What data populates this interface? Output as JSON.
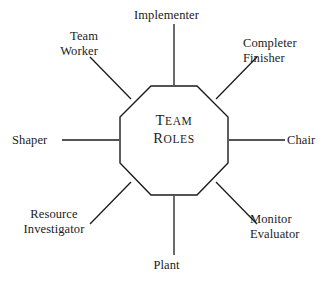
{
  "diagram": {
    "type": "radial-octagon-label-diagram",
    "title": "Team Roles",
    "background_color": "#ffffff",
    "stroke_color": "#1b1b1b",
    "text_color": "#1b1b1b",
    "center": {
      "shape": "octagon",
      "label_line1": "Team",
      "label_line2": "Roles",
      "label_line1_cap": "T",
      "label_line1_rest": "EAM",
      "label_line2_cap": "R",
      "label_line2_rest": "OLES",
      "style": "small-caps"
    },
    "nodes": [
      {
        "id": "implementer",
        "label": "Implementer",
        "lines": [
          "Implementer"
        ],
        "position": "top",
        "connector": "vertical"
      },
      {
        "id": "team-worker",
        "label": "Team Worker",
        "lines": [
          "Team",
          "Worker"
        ],
        "position": "top-left",
        "connector": "diagonal"
      },
      {
        "id": "completer-finisher",
        "label": "Completer Finisher",
        "lines": [
          "Completer",
          "Finisher"
        ],
        "position": "top-right",
        "connector": "diagonal"
      },
      {
        "id": "shaper",
        "label": "Shaper",
        "lines": [
          "Shaper"
        ],
        "position": "left",
        "connector": "horizontal"
      },
      {
        "id": "chair",
        "label": "Chair",
        "lines": [
          "Chair"
        ],
        "position": "right",
        "connector": "horizontal"
      },
      {
        "id": "resource-investigator",
        "label": "Resource Investigator",
        "lines": [
          "Resource",
          "Investigator"
        ],
        "position": "bottom-left",
        "connector": "diagonal"
      },
      {
        "id": "monitor-evaluator",
        "label": "Monitor Evaluator",
        "lines": [
          "Monitor",
          "Evaluator"
        ],
        "position": "bottom-right",
        "connector": "diagonal"
      },
      {
        "id": "plant",
        "label": "Plant",
        "lines": [
          "Plant"
        ],
        "position": "bottom",
        "connector": "vertical"
      }
    ]
  }
}
